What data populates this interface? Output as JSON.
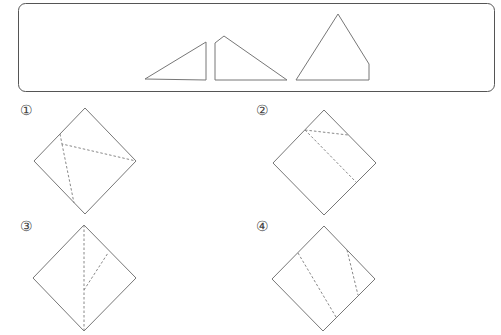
{
  "figure": {
    "pieces_box": {
      "pieces": [
        {
          "name": "small-right-triangle",
          "points": "145,79 206,42 206,80"
        },
        {
          "name": "quadrilateral-piece",
          "points": "215,43 224,36 287,80 215,80"
        },
        {
          "name": "pentagon-piece",
          "points": "296,80 338,14 369,64 369,80"
        }
      ]
    },
    "options": [
      {
        "label": "①",
        "square": "85,108 136,161 85,214 34,161",
        "folds": [
          "60,134 62,144 136,161",
          "62,144 74,203"
        ]
      },
      {
        "label": "②",
        "square": "324,110 376,163 324,215 273,163",
        "folds": [
          "305,130 348,135",
          "305,130 356,182"
        ]
      },
      {
        "label": "③",
        "square": "84,225 136,278 84,331 33,278",
        "folds": [
          "84,225 84,331",
          "84,290 108,253"
        ]
      },
      {
        "label": "④",
        "square": "324,226 375,279 323,331 272,279",
        "folds": [
          "298,253 336,317",
          "347,250 358,295"
        ]
      }
    ]
  }
}
